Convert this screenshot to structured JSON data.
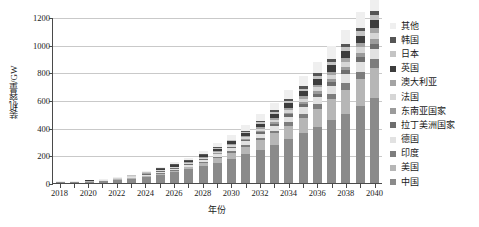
{
  "chart_data": {
    "type": "bar",
    "stacked": true,
    "title": "",
    "xlabel": "年份",
    "ylabel": "装机容量/GW",
    "ylim": [
      0,
      1200
    ],
    "ytick_values": [
      0,
      200,
      400,
      600,
      800,
      1000,
      1200
    ],
    "ytick_labels": [
      "0",
      "200",
      "400",
      "600",
      "800",
      "1000",
      "1200"
    ],
    "grid": "horizontal",
    "legend_position": "right",
    "categories": [
      "2018",
      "2019",
      "2020",
      "2021",
      "2022",
      "2023",
      "2024",
      "2025",
      "2026",
      "2027",
      "2028",
      "2029",
      "2030",
      "2031",
      "2032",
      "2033",
      "2034",
      "2035",
      "2036",
      "2037",
      "2038",
      "2039",
      "2040"
    ],
    "xtick_labels": [
      "2018",
      "2020",
      "2022",
      "2024",
      "2026",
      "2028",
      "2030",
      "2032",
      "2034",
      "2036",
      "2038",
      "2040"
    ],
    "series": [
      {
        "name": "中国",
        "color": "#8a8a8a",
        "values": [
          5,
          7,
          10,
          14,
          22,
          32,
          44,
          60,
          78,
          98,
          122,
          148,
          176,
          208,
          242,
          278,
          318,
          360,
          404,
          452,
          502,
          556,
          612
        ]
      },
      {
        "name": "美国",
        "color": "#b6b6b6",
        "values": [
          0,
          0,
          1,
          1,
          2,
          3,
          5,
          8,
          12,
          17,
          24,
          32,
          42,
          53,
          66,
          80,
          96,
          113,
          132,
          152,
          174,
          197,
          222
        ]
      },
      {
        "name": "印度",
        "color": "#7d7d7d",
        "values": [
          0,
          0,
          0,
          0,
          0,
          1,
          1,
          2,
          3,
          4,
          6,
          8,
          10,
          13,
          16,
          20,
          24,
          29,
          34,
          40,
          46,
          53,
          60
        ]
      },
      {
        "name": "德国",
        "color": "#e2e2e2",
        "values": [
          1,
          2,
          2,
          3,
          4,
          5,
          7,
          9,
          11,
          14,
          17,
          20,
          24,
          28,
          32,
          37,
          42,
          47,
          52,
          58,
          64,
          70,
          76
        ]
      },
      {
        "name": "拉丁美洲国家",
        "color": "#6e6e6e",
        "values": [
          0,
          0,
          0,
          0,
          0,
          0,
          1,
          1,
          2,
          3,
          4,
          5,
          7,
          9,
          11,
          13,
          16,
          19,
          22,
          26,
          30,
          34,
          38
        ]
      },
      {
        "name": "东南亚国家",
        "color": "#9b9b9b",
        "values": [
          0,
          0,
          0,
          0,
          0,
          0,
          0,
          1,
          1,
          2,
          3,
          4,
          5,
          7,
          9,
          11,
          13,
          16,
          19,
          22,
          26,
          30,
          34
        ]
      },
      {
        "name": "法国",
        "color": "#d6d6d6",
        "values": [
          0,
          0,
          0,
          0,
          1,
          1,
          2,
          3,
          4,
          5,
          7,
          9,
          11,
          13,
          16,
          19,
          22,
          25,
          28,
          32,
          36,
          40,
          44
        ]
      },
      {
        "name": "澳大利亚",
        "color": "#a4a4a4",
        "values": [
          0,
          0,
          0,
          0,
          0,
          0,
          1,
          1,
          2,
          3,
          4,
          5,
          7,
          8,
          10,
          12,
          14,
          17,
          20,
          23,
          26,
          29,
          33
        ]
      },
      {
        "name": "英国",
        "color": "#3d3d3d",
        "values": [
          0,
          0,
          1,
          1,
          2,
          3,
          4,
          6,
          8,
          10,
          13,
          16,
          19,
          22,
          26,
          30,
          34,
          38,
          42,
          47,
          52,
          57,
          62
        ]
      },
      {
        "name": "日本",
        "color": "#c4c4c4",
        "values": [
          0,
          0,
          0,
          0,
          0,
          1,
          1,
          2,
          3,
          4,
          5,
          7,
          8,
          10,
          12,
          14,
          16,
          19,
          22,
          25,
          28,
          31,
          34
        ]
      },
      {
        "name": "韩国",
        "color": "#555555",
        "values": [
          0,
          0,
          0,
          0,
          0,
          0,
          1,
          1,
          2,
          3,
          4,
          5,
          6,
          8,
          10,
          12,
          14,
          16,
          18,
          21,
          24,
          27,
          30
        ]
      },
      {
        "name": "其他",
        "color": "#efefef",
        "values": [
          1,
          1,
          2,
          3,
          4,
          6,
          8,
          11,
          14,
          18,
          23,
          28,
          34,
          41,
          48,
          56,
          64,
          73,
          82,
          92,
          102,
          113,
          125
        ]
      }
    ],
    "legend_entries": [
      {
        "label": "其他",
        "color": "#efefef"
      },
      {
        "label": "韩国",
        "color": "#555555"
      },
      {
        "label": "日本",
        "color": "#c4c4c4"
      },
      {
        "label": "英国",
        "color": "#3d3d3d"
      },
      {
        "label": "澳大利亚",
        "color": "#a4a4a4"
      },
      {
        "label": "法国",
        "color": "#d6d6d6"
      },
      {
        "label": "东南亚国家",
        "color": "#9b9b9b"
      },
      {
        "label": "拉丁美洲国家",
        "color": "#6e6e6e"
      },
      {
        "label": "德国",
        "color": "#e2e2e2"
      },
      {
        "label": "印度",
        "color": "#7d7d7d"
      },
      {
        "label": "美国",
        "color": "#b6b6b6"
      },
      {
        "label": "中国",
        "color": "#8a8a8a"
      }
    ]
  }
}
